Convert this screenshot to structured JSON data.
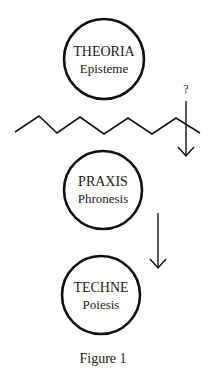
{
  "diagram": {
    "nodes": [
      {
        "id": "theoria",
        "title": "THEORIA",
        "subtitle": "Episteme"
      },
      {
        "id": "praxis",
        "title": "PRAXIS",
        "subtitle": "Phronesis"
      },
      {
        "id": "techne",
        "title": "TECHNE",
        "subtitle": "Poiesis"
      }
    ],
    "question_mark": "?",
    "caption": "Figure 1",
    "edges": [
      {
        "from": "boundary",
        "to": "praxis",
        "label": "?"
      },
      {
        "from": "praxis",
        "to": "techne",
        "label": ""
      }
    ],
    "colors": {
      "stroke": "#111111",
      "background": "#ffffff"
    }
  }
}
